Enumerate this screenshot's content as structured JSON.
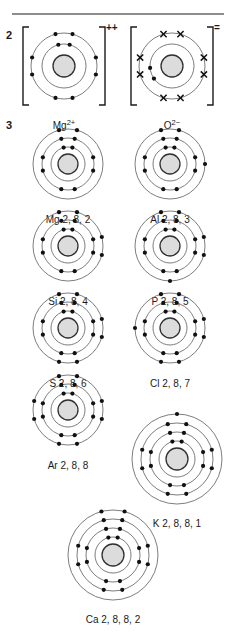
{
  "page": {
    "width": 232,
    "height": 643,
    "background": "#ffffff",
    "rule_color": "#8c8c8c"
  },
  "style": {
    "ring_color": "#6e6e6e",
    "nucleus_fill": "#dcdcdc",
    "nucleus_stroke": "#303030",
    "electron_color": "#111111",
    "bracket_color": "#1a1a1a"
  },
  "questions": [
    {
      "id": "q2",
      "number": "2",
      "left": 6,
      "top": 30
    },
    {
      "id": "q3",
      "number": "3",
      "left": 6,
      "top": 120
    }
  ],
  "ions": [
    {
      "name": "magnesium-ion",
      "label_html": "Mg<sup>2+</sup>",
      "label_text": "Mg2+",
      "charge_sign": "++",
      "left": 22,
      "top": 24,
      "size": 84,
      "nucleus_radius": 11,
      "shell_radii": [
        22,
        33
      ],
      "shells": [
        {
          "count": 2,
          "marker": "dot",
          "start_angle": -90
        },
        {
          "count": 8,
          "marker": "dot",
          "start_angle": -90
        }
      ]
    },
    {
      "name": "oxide-ion",
      "label_html": "O<sup>2&#8722;</sup>",
      "label_text": "O2-",
      "charge_sign": "=",
      "left": 130,
      "top": 24,
      "size": 84,
      "nucleus_radius": 11,
      "shell_radii": [
        22,
        33
      ],
      "shells": [
        {
          "count": 2,
          "marker": "dot",
          "start_angle": 160
        },
        {
          "count": 8,
          "marker": "cross",
          "start_angle": -90
        }
      ]
    }
  ],
  "atoms": [
    {
      "name": "magnesium-atom",
      "label": "Mg 2, 8, 2",
      "left": 30,
      "top": 126,
      "size": 76,
      "nucleus_radius": 10,
      "shell_radii": [
        17,
        26,
        35
      ],
      "shells": [
        {
          "count": 2,
          "marker": "dot",
          "start_angle": -90
        },
        {
          "count": 8,
          "marker": "dot",
          "start_angle": -90
        },
        {
          "count": 2,
          "marker": "dot",
          "start_angle": -90
        }
      ]
    },
    {
      "name": "aluminium-atom",
      "label": "Al 2, 8, 3",
      "left": 132,
      "top": 126,
      "size": 76,
      "nucleus_radius": 10,
      "shell_radii": [
        17,
        26,
        35
      ],
      "shells": [
        {
          "count": 2,
          "marker": "dot",
          "start_angle": -90
        },
        {
          "count": 8,
          "marker": "dot",
          "start_angle": -90
        },
        {
          "count": 3,
          "marker": "dot",
          "start_angle": -90
        }
      ]
    },
    {
      "name": "silicon-atom",
      "label": "Si 2, 8, 4",
      "left": 30,
      "top": 208,
      "size": 76,
      "nucleus_radius": 10,
      "shell_radii": [
        17,
        26,
        35
      ],
      "shells": [
        {
          "count": 2,
          "marker": "dot",
          "start_angle": -90
        },
        {
          "count": 8,
          "marker": "dot",
          "start_angle": -90
        },
        {
          "count": 4,
          "marker": "dot",
          "start_angle": -90
        }
      ]
    },
    {
      "name": "phosphorus-atom",
      "label": "P 2, 8, 5",
      "left": 132,
      "top": 208,
      "size": 76,
      "nucleus_radius": 10,
      "shell_radii": [
        17,
        26,
        35
      ],
      "shells": [
        {
          "count": 2,
          "marker": "dot",
          "start_angle": -90
        },
        {
          "count": 8,
          "marker": "dot",
          "start_angle": -90
        },
        {
          "count": 5,
          "marker": "dot",
          "start_angle": -90
        }
      ]
    },
    {
      "name": "sulfur-atom",
      "label": "S 2, 8, 6",
      "left": 30,
      "top": 290,
      "size": 76,
      "nucleus_radius": 10,
      "shell_radii": [
        17,
        26,
        35
      ],
      "shells": [
        {
          "count": 2,
          "marker": "dot",
          "start_angle": -90
        },
        {
          "count": 8,
          "marker": "dot",
          "start_angle": -90
        },
        {
          "count": 6,
          "marker": "dot",
          "start_angle": -90
        }
      ]
    },
    {
      "name": "chlorine-atom",
      "label": "Cl 2, 8, 7",
      "left": 132,
      "top": 290,
      "size": 76,
      "nucleus_radius": 10,
      "shell_radii": [
        17,
        26,
        35
      ],
      "shells": [
        {
          "count": 2,
          "marker": "dot",
          "start_angle": -90
        },
        {
          "count": 8,
          "marker": "dot",
          "start_angle": -90
        },
        {
          "count": 7,
          "marker": "dot",
          "start_angle": -90
        }
      ]
    },
    {
      "name": "argon-atom",
      "label": "Ar 2, 8, 8",
      "left": 30,
      "top": 372,
      "size": 76,
      "nucleus_radius": 10,
      "shell_radii": [
        17,
        26,
        35
      ],
      "shells": [
        {
          "count": 2,
          "marker": "dot",
          "start_angle": -90
        },
        {
          "count": 8,
          "marker": "dot",
          "start_angle": -90
        },
        {
          "count": 8,
          "marker": "dot",
          "start_angle": -90
        }
      ]
    },
    {
      "name": "potassium-atom",
      "label": "K 2, 8, 8, 1",
      "left": 130,
      "top": 412,
      "size": 94,
      "nucleus_radius": 11,
      "shell_radii": [
        18,
        27,
        36,
        45
      ],
      "shells": [
        {
          "count": 2,
          "marker": "dot",
          "start_angle": -90
        },
        {
          "count": 8,
          "marker": "dot",
          "start_angle": -90
        },
        {
          "count": 8,
          "marker": "dot",
          "start_angle": -90
        },
        {
          "count": 1,
          "marker": "dot",
          "start_angle": -90
        }
      ]
    },
    {
      "name": "calcium-atom",
      "label": "Ca 2, 8, 8, 2",
      "left": 66,
      "top": 508,
      "size": 94,
      "nucleus_radius": 11,
      "shell_radii": [
        18,
        27,
        36,
        45
      ],
      "shells": [
        {
          "count": 2,
          "marker": "dot",
          "start_angle": -90
        },
        {
          "count": 8,
          "marker": "dot",
          "start_angle": -90
        },
        {
          "count": 8,
          "marker": "dot",
          "start_angle": -90
        },
        {
          "count": 2,
          "marker": "dot",
          "start_angle": -90
        }
      ]
    }
  ]
}
